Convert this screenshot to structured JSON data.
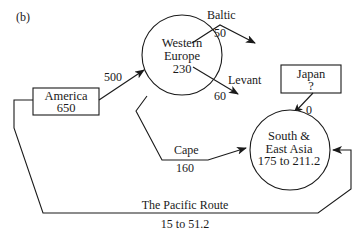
{
  "panel_label": "(b)",
  "nodes": {
    "america": {
      "name": "America",
      "value": "650"
    },
    "western_europe": {
      "name_line1": "Western",
      "name_line2": "Europe",
      "value": "230"
    },
    "japan": {
      "name": "Japan",
      "value": "?"
    },
    "south_east_asia": {
      "name_line1": "South &",
      "name_line2": "East Asia",
      "value": "175 to 211.2"
    }
  },
  "flows": {
    "america_to_europe": {
      "value": "500"
    },
    "baltic": {
      "name": "Baltic",
      "value": "50"
    },
    "levant": {
      "name": "Levant",
      "value": "60"
    },
    "japan_to_asia": {
      "value": "0"
    },
    "cape": {
      "name": "Cape",
      "value": "160"
    },
    "pacific": {
      "name": "The Pacific Route",
      "value": "15 to 51.2"
    }
  }
}
